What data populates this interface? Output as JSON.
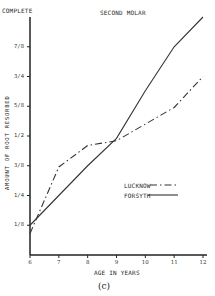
{
  "chart_data": {
    "type": "line",
    "title": "SECOND MOLAR",
    "top_label": "COMPLETE",
    "xlabel": "AGE IN YEARS",
    "ylabel": "AMOUNT OF ROOT RESORBED",
    "caption": "(c)",
    "x": [
      6,
      7,
      8,
      9,
      10,
      11,
      12
    ],
    "xlim": [
      6,
      12
    ],
    "ylim": [
      0,
      1
    ],
    "yticks": [
      {
        "value": 0.125,
        "label": "1/8"
      },
      {
        "value": 0.25,
        "label": "1/4"
      },
      {
        "value": 0.375,
        "label": "3/8"
      },
      {
        "value": 0.5,
        "label": "1/2"
      },
      {
        "value": 0.625,
        "label": "5/8"
      },
      {
        "value": 0.75,
        "label": "3/4"
      },
      {
        "value": 0.875,
        "label": "7/8"
      }
    ],
    "xticks": [
      "6",
      "7",
      "8",
      "9",
      "10",
      "11",
      "12"
    ],
    "grid": false,
    "legend_position": "center-right",
    "series": [
      {
        "name": "LUCKNOW",
        "style": "dash-dot",
        "values": [
          0.09,
          0.37,
          0.46,
          0.48,
          0.55,
          0.62,
          0.75
        ]
      },
      {
        "name": "FORSYTH",
        "style": "solid",
        "values": [
          0.125,
          0.25,
          0.375,
          0.49,
          0.69,
          0.875,
          1.0
        ]
      }
    ]
  }
}
